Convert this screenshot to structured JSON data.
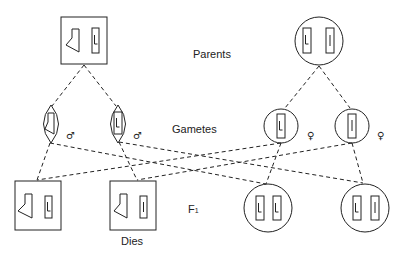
{
  "labels": {
    "parents": "Parents",
    "gametes": "Gametes",
    "f1": "F",
    "f1_sub": "1",
    "dies": "Dies"
  },
  "symbols": {
    "male": "♂",
    "female": "♀"
  },
  "parents": [
    {
      "sex": "male",
      "shape": "square",
      "chromosomes": [
        "deleted",
        "L"
      ]
    },
    {
      "sex": "female",
      "shape": "circle",
      "chromosomes": [
        "L",
        "l"
      ]
    }
  ],
  "gametes": [
    {
      "sex": "male",
      "chromosome": "deleted"
    },
    {
      "sex": "male",
      "chromosome": "L"
    },
    {
      "sex": "female",
      "chromosome": "L"
    },
    {
      "sex": "female",
      "chromosome": "l"
    }
  ],
  "f1": [
    {
      "sex": "male",
      "shape": "square",
      "chromosomes": [
        "deleted",
        "L"
      ],
      "note": ""
    },
    {
      "sex": "male",
      "shape": "square",
      "chromosomes": [
        "deleted",
        "l"
      ],
      "note": "Dies"
    },
    {
      "sex": "female",
      "shape": "circle",
      "chromosomes": [
        "L",
        "L"
      ],
      "note": ""
    },
    {
      "sex": "female",
      "shape": "circle",
      "chromosomes": [
        "L",
        "l"
      ],
      "note": ""
    }
  ]
}
